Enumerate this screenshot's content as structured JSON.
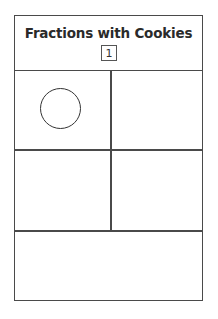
{
  "worksheet": {
    "title": "Fractions with Cookies",
    "page_number": "1",
    "grid": {
      "rows": 2,
      "columns": 2,
      "cells": [
        {
          "position": "top-left",
          "content": "cookie-circle"
        },
        {
          "position": "top-right",
          "content": ""
        },
        {
          "position": "bottom-left",
          "content": ""
        },
        {
          "position": "bottom-right",
          "content": ""
        }
      ]
    },
    "footer_box": ""
  }
}
